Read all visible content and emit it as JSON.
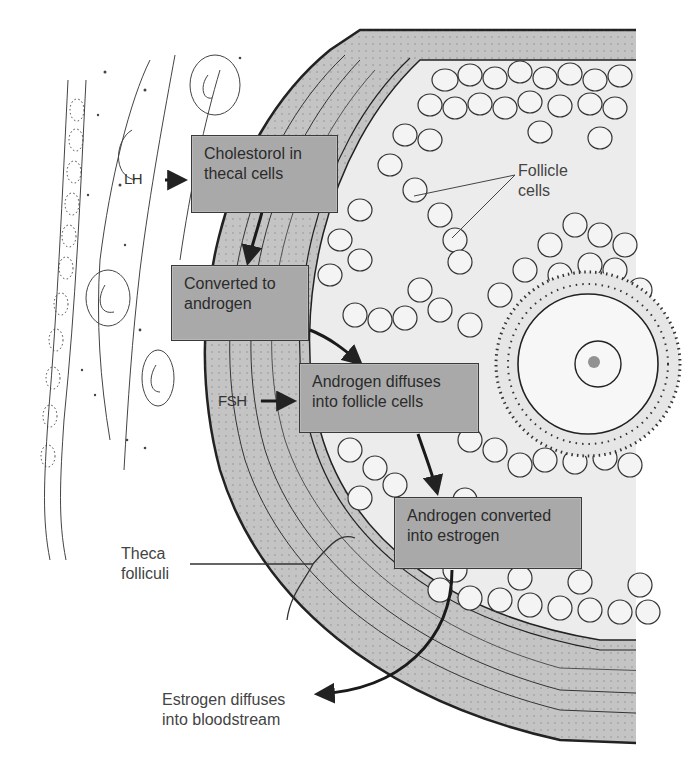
{
  "figure": {
    "colors": {
      "box_fill": "#a9a9a9",
      "box_border": "#3a3a3a",
      "theca_fill": "#c4c4c4",
      "antrum_fill": "#ececec",
      "line": "#222222",
      "text": "#2b2b2b"
    }
  },
  "hormones": {
    "lh": "LH",
    "fsh": "FSH"
  },
  "steps": [
    {
      "line1": "Cholestorol in",
      "line2": "thecal cells"
    },
    {
      "line1": "Converted to",
      "line2": "androgen"
    },
    {
      "line1": "Androgen diffuses",
      "line2": "into  follicle cells"
    },
    {
      "line1": "Androgen converted",
      "line2": "into estrogen"
    }
  ],
  "labels": {
    "follicle_cells": {
      "line1": "Follicle",
      "line2": "cells"
    },
    "theca_folliculi": {
      "line1": "Theca",
      "line2": "folliculi"
    },
    "estrogen_out": {
      "line1": "Estrogen diffuses",
      "line2": "into bloodstream"
    }
  }
}
